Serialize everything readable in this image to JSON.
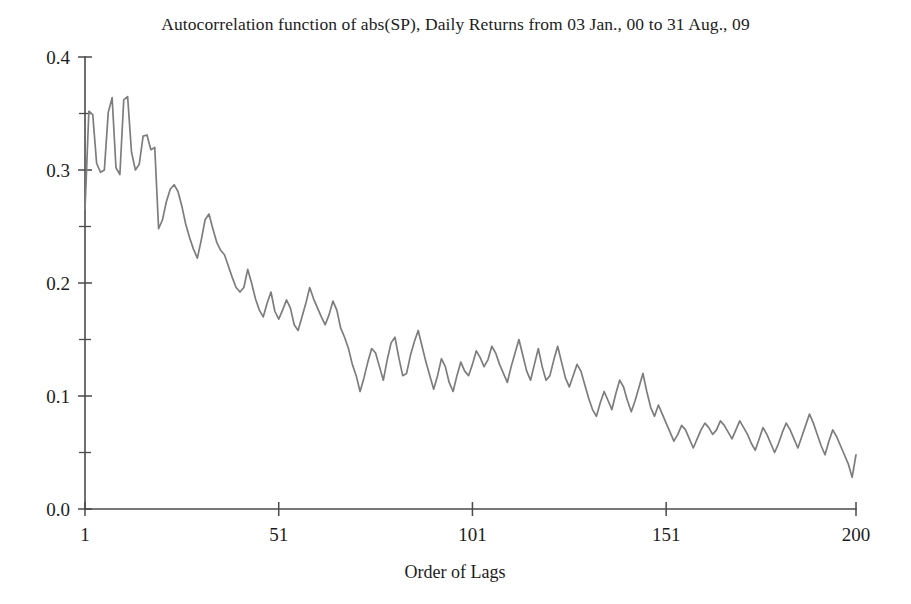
{
  "chart_data": {
    "type": "line",
    "title": "Autocorrelation function of abs(SP), Daily Returns from 03 Jan., 00 to 31 Aug., 09",
    "xlabel": "Order of Lags",
    "ylabel": "",
    "xlim": [
      1,
      200
    ],
    "ylim": [
      0.0,
      0.4
    ],
    "grid": false,
    "legend": null,
    "line_color": "#7d7d7d",
    "axis_color": "#4a4a4a",
    "xticks": [
      1,
      51,
      101,
      151,
      200
    ],
    "xtick_labels": [
      "1",
      "51",
      "101",
      "151",
      "200"
    ],
    "yticks": [
      0.0,
      0.1,
      0.2,
      0.3,
      0.4
    ],
    "ytick_labels": [
      "0.0",
      "0.1",
      "0.2",
      "0.3",
      "0.4"
    ],
    "yticks_minor": [
      0.05,
      0.15,
      0.25,
      0.35
    ],
    "series": [
      {
        "name": "ACF of abs(SP)",
        "x": [
          1,
          2,
          3,
          4,
          5,
          6,
          7,
          8,
          9,
          10,
          11,
          12,
          13,
          14,
          15,
          16,
          17,
          18,
          19,
          20,
          21,
          22,
          23,
          24,
          25,
          26,
          27,
          28,
          29,
          30,
          31,
          32,
          33,
          34,
          35,
          36,
          37,
          38,
          39,
          40,
          41,
          42,
          43,
          44,
          45,
          46,
          47,
          48,
          49,
          50,
          51,
          52,
          53,
          54,
          55,
          56,
          57,
          58,
          59,
          60,
          61,
          62,
          63,
          64,
          65,
          66,
          67,
          68,
          69,
          70,
          71,
          72,
          73,
          74,
          75,
          76,
          77,
          78,
          79,
          80,
          81,
          82,
          83,
          84,
          85,
          86,
          87,
          88,
          89,
          90,
          91,
          92,
          93,
          94,
          95,
          96,
          97,
          98,
          99,
          100,
          101,
          102,
          103,
          104,
          105,
          106,
          107,
          108,
          109,
          110,
          111,
          112,
          113,
          114,
          115,
          116,
          117,
          118,
          119,
          120,
          121,
          122,
          123,
          124,
          125,
          126,
          127,
          128,
          129,
          130,
          131,
          132,
          133,
          134,
          135,
          136,
          137,
          138,
          139,
          140,
          141,
          142,
          143,
          144,
          145,
          146,
          147,
          148,
          149,
          150,
          151,
          152,
          153,
          154,
          155,
          156,
          157,
          158,
          159,
          160,
          161,
          162,
          163,
          164,
          165,
          166,
          167,
          168,
          169,
          170,
          171,
          172,
          173,
          174,
          175,
          176,
          177,
          178,
          179,
          180,
          181,
          182,
          183,
          184,
          185,
          186,
          187,
          188,
          189,
          190,
          191,
          192,
          193,
          194,
          195,
          196,
          197,
          198,
          199,
          200
        ],
        "values": [
          0.265,
          0.352,
          0.349,
          0.306,
          0.298,
          0.3,
          0.351,
          0.364,
          0.302,
          0.296,
          0.362,
          0.365,
          0.316,
          0.3,
          0.305,
          0.33,
          0.331,
          0.318,
          0.32,
          0.248,
          0.256,
          0.272,
          0.283,
          0.287,
          0.281,
          0.268,
          0.252,
          0.24,
          0.23,
          0.222,
          0.238,
          0.256,
          0.261,
          0.248,
          0.236,
          0.229,
          0.225,
          0.215,
          0.205,
          0.196,
          0.192,
          0.196,
          0.212,
          0.2,
          0.186,
          0.176,
          0.17,
          0.182,
          0.192,
          0.175,
          0.168,
          0.176,
          0.185,
          0.178,
          0.163,
          0.158,
          0.17,
          0.182,
          0.196,
          0.186,
          0.178,
          0.17,
          0.163,
          0.172,
          0.184,
          0.176,
          0.16,
          0.152,
          0.142,
          0.128,
          0.118,
          0.104,
          0.116,
          0.13,
          0.142,
          0.138,
          0.126,
          0.114,
          0.132,
          0.147,
          0.152,
          0.134,
          0.118,
          0.12,
          0.136,
          0.148,
          0.158,
          0.144,
          0.13,
          0.118,
          0.106,
          0.118,
          0.133,
          0.126,
          0.112,
          0.104,
          0.118,
          0.13,
          0.122,
          0.118,
          0.128,
          0.14,
          0.134,
          0.126,
          0.132,
          0.144,
          0.138,
          0.128,
          0.12,
          0.112,
          0.126,
          0.138,
          0.15,
          0.136,
          0.122,
          0.114,
          0.128,
          0.142,
          0.126,
          0.114,
          0.118,
          0.132,
          0.144,
          0.13,
          0.116,
          0.108,
          0.118,
          0.128,
          0.122,
          0.11,
          0.098,
          0.088,
          0.082,
          0.094,
          0.104,
          0.096,
          0.088,
          0.102,
          0.114,
          0.108,
          0.096,
          0.086,
          0.096,
          0.108,
          0.12,
          0.104,
          0.09,
          0.082,
          0.092,
          0.084,
          0.076,
          0.068,
          0.06,
          0.066,
          0.074,
          0.07,
          0.062,
          0.054,
          0.062,
          0.07,
          0.076,
          0.072,
          0.066,
          0.07,
          0.078,
          0.074,
          0.068,
          0.062,
          0.07,
          0.078,
          0.072,
          0.066,
          0.058,
          0.052,
          0.062,
          0.072,
          0.066,
          0.058,
          0.05,
          0.058,
          0.068,
          0.076,
          0.07,
          0.062,
          0.054,
          0.064,
          0.074,
          0.084,
          0.076,
          0.066,
          0.056,
          0.048,
          0.06,
          0.07,
          0.064,
          0.056,
          0.048,
          0.04,
          0.028,
          0.048
        ]
      }
    ]
  }
}
